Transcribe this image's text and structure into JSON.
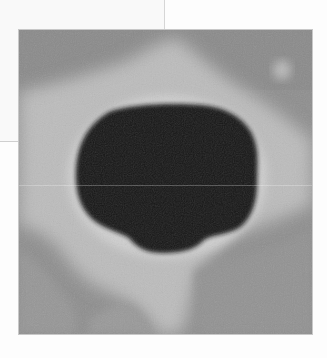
{
  "figure": {
    "colors": {
      "background": "#ffffff",
      "outer_gray": "#8f8f8f",
      "halo": "#bdbdbd",
      "pore": "#141414",
      "frame_line": "#d6d6d6"
    }
  }
}
